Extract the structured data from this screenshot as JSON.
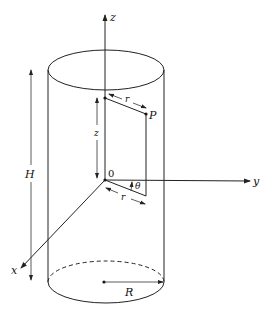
{
  "figure": {
    "labels": {
      "z_axis": "z",
      "y_axis": "y",
      "x_axis": "x",
      "origin": "0",
      "point": "P",
      "radius_top": "r",
      "radius_bottom": "r",
      "height_z": "z",
      "angle": "θ",
      "cylinder_height": "H",
      "cylinder_radius": "R"
    }
  }
}
